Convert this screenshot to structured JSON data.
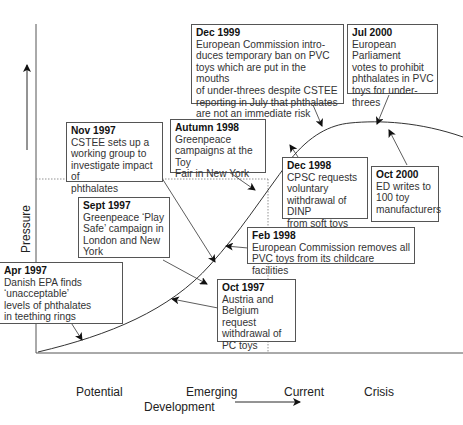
{
  "axes": {
    "x_label": "Development",
    "y_label": "Pressure",
    "stages": [
      "Potential",
      "Emerging",
      "Current",
      "Crisis"
    ]
  },
  "events": [
    {
      "id": "dec-1999",
      "date": "Dec 1999",
      "text": "European Commission intro-\nduces temporary ban on PVC\ntoys which are put in the mouths\nof under-threes despite CSTEE\nreporting in July that phthalates\nare not an immediate risk"
    },
    {
      "id": "jul-2000",
      "date": "Jul 2000",
      "text": "European Parliament\nvotes to prohibit\nphthalates in PVC\ntoys for under-threes"
    },
    {
      "id": "nov-1997",
      "date": "Nov 1997",
      "text": "CSTEE sets up a\nworking group to\ninvestigate impact of\nphthalates"
    },
    {
      "id": "autumn-1998",
      "date": "Autumn 1998",
      "text": "Greenpeace\ncampaigns at the Toy\nFair in New York"
    },
    {
      "id": "dec-1998",
      "date": "Dec 1998",
      "text": "CPSC requests\nvoluntary\nwithdrawal of DINP\nfrom soft toys"
    },
    {
      "id": "oct-2000",
      "date": "Oct 2000",
      "text": "ED writes to\n100 toy\nmanufacturers"
    },
    {
      "id": "sept-1997",
      "date": "Sept 1997",
      "text": "Greenpeace ‘Play\nSafe’ campaign in\nLondon and New\nYork"
    },
    {
      "id": "feb-1998",
      "date": "Feb 1998",
      "text": "European Commission removes all\nPVC toys from its childcare facilities"
    },
    {
      "id": "apr-1997",
      "date": "Apr 1997",
      "text": "Danish EPA finds\n‘unacceptable’\nlevels of phthalates\nin teething rings"
    },
    {
      "id": "oct-1997",
      "date": "Oct 1997",
      "text": "Austria and\nBelgium request\nwithdrawal of\nPC toys"
    }
  ]
}
